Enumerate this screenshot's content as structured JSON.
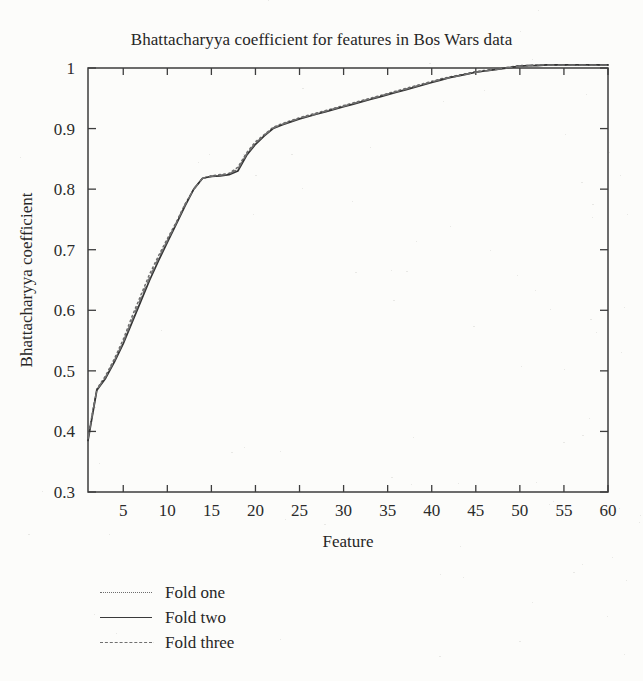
{
  "chart_data": {
    "type": "line",
    "title": "Bhattacharyya coefficient for features in Bos Wars data",
    "xlabel": "Feature",
    "ylabel": "Bhattacharyya coefficient",
    "xlim": [
      1,
      60
    ],
    "ylim": [
      0.3,
      1.0
    ],
    "xticks": [
      5,
      10,
      15,
      20,
      25,
      30,
      35,
      40,
      45,
      50,
      55,
      60
    ],
    "xtick_labels": [
      "5",
      "10",
      "15",
      "20",
      "25",
      "30",
      "35",
      "40",
      "45",
      "50",
      "55",
      "60"
    ],
    "yticks": [
      0.3,
      0.4,
      0.5,
      0.6,
      0.7,
      0.8,
      0.9,
      1.0
    ],
    "ytick_labels": [
      "0.3",
      "0.4",
      "0.5",
      "0.6",
      "0.7",
      "0.8",
      "0.9",
      "1"
    ],
    "grid": false,
    "legend_position": "below-axes-left",
    "x": [
      1,
      2,
      3,
      4,
      5,
      6,
      7,
      8,
      9,
      10,
      11,
      12,
      13,
      14,
      15,
      16,
      17,
      18,
      19,
      20,
      21,
      22,
      23,
      24,
      25,
      26,
      27,
      28,
      29,
      30,
      31,
      32,
      33,
      34,
      35,
      36,
      37,
      38,
      39,
      40,
      41,
      42,
      43,
      44,
      45,
      46,
      47,
      48,
      49,
      50,
      51,
      52,
      53,
      54,
      55,
      56,
      57,
      58,
      59,
      60
    ],
    "series": [
      {
        "name": "Fold one",
        "style": "dotted",
        "color": "#6d6d6d",
        "values": [
          0.39,
          0.47,
          0.492,
          0.52,
          0.552,
          0.59,
          0.625,
          0.66,
          0.69,
          0.718,
          0.745,
          0.775,
          0.8,
          0.818,
          0.822,
          0.824,
          0.826,
          0.836,
          0.86,
          0.878,
          0.89,
          0.902,
          0.908,
          0.913,
          0.918,
          0.922,
          0.926,
          0.93,
          0.934,
          0.938,
          0.942,
          0.946,
          0.95,
          0.954,
          0.958,
          0.962,
          0.966,
          0.97,
          0.974,
          0.978,
          0.982,
          0.985,
          0.988,
          0.991,
          0.994,
          0.996,
          0.998,
          1.0,
          1.002,
          1.004,
          1.004,
          1.005,
          1.005,
          1.005,
          1.005,
          1.005,
          1.005,
          1.005,
          1.005,
          1.005
        ]
      },
      {
        "name": "Fold two",
        "style": "solid",
        "color": "#333333",
        "values": [
          0.385,
          0.468,
          0.488,
          0.515,
          0.545,
          0.58,
          0.615,
          0.65,
          0.682,
          0.712,
          0.742,
          0.772,
          0.8,
          0.818,
          0.821,
          0.822,
          0.824,
          0.83,
          0.856,
          0.874,
          0.888,
          0.9,
          0.906,
          0.911,
          0.916,
          0.92,
          0.924,
          0.928,
          0.932,
          0.936,
          0.94,
          0.944,
          0.948,
          0.952,
          0.956,
          0.96,
          0.964,
          0.968,
          0.972,
          0.976,
          0.98,
          0.984,
          0.987,
          0.99,
          0.993,
          0.995,
          0.997,
          0.999,
          1.001,
          1.003,
          1.004,
          1.004,
          1.005,
          1.005,
          1.005,
          1.005,
          1.005,
          1.005,
          1.005,
          1.005
        ]
      },
      {
        "name": "Fold three",
        "style": "dashed",
        "color": "#707070",
        "values": [
          0.388,
          0.469,
          0.49,
          0.517,
          0.548,
          0.584,
          0.62,
          0.654,
          0.686,
          0.715,
          0.744,
          0.774,
          0.8,
          0.818,
          0.821,
          0.823,
          0.825,
          0.833,
          0.858,
          0.876,
          0.889,
          0.901,
          0.907,
          0.912,
          0.917,
          0.921,
          0.925,
          0.929,
          0.933,
          0.937,
          0.941,
          0.945,
          0.949,
          0.953,
          0.957,
          0.961,
          0.965,
          0.969,
          0.973,
          0.977,
          0.981,
          0.984,
          0.987,
          0.99,
          0.993,
          0.995,
          0.997,
          0.999,
          1.001,
          1.003,
          1.004,
          1.005,
          1.005,
          1.005,
          1.005,
          1.005,
          1.005,
          1.005,
          1.005,
          1.005
        ]
      }
    ]
  },
  "legend": {
    "items": [
      {
        "label": "Fold one"
      },
      {
        "label": "Fold two"
      },
      {
        "label": "Fold three"
      }
    ]
  }
}
